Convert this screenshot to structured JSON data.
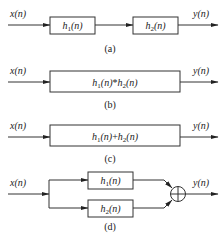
{
  "diagram": {
    "panels": [
      {
        "id": "a",
        "caption": "(a)",
        "input": "x(n)",
        "output": "y(n)",
        "blocks": [
          {
            "name": "h",
            "sub": "1",
            "arg": "(n)"
          },
          {
            "name": "h",
            "sub": "2",
            "arg": "(n)"
          }
        ]
      },
      {
        "id": "b",
        "caption": "(b)",
        "input": "x(n)",
        "output": "y(n)",
        "block": {
          "p1": "h",
          "s1": "1",
          "a1": "(n)",
          "op": "*",
          "p2": "h",
          "s2": "2",
          "a2": "(n)"
        }
      },
      {
        "id": "c",
        "caption": "(c)",
        "input": "x(n)",
        "output": "y(n)",
        "block": {
          "p1": "h",
          "s1": "1",
          "a1": "(n)",
          "op": "+",
          "p2": "h",
          "s2": "2",
          "a2": "(n)"
        }
      },
      {
        "id": "d",
        "caption": "(d)",
        "input": "x(n)",
        "output": "y(n)",
        "blocks": [
          {
            "name": "h",
            "sub": "1",
            "arg": "(n)"
          },
          {
            "name": "h",
            "sub": "2",
            "arg": "(n)"
          }
        ],
        "junction": "⊕"
      }
    ]
  }
}
